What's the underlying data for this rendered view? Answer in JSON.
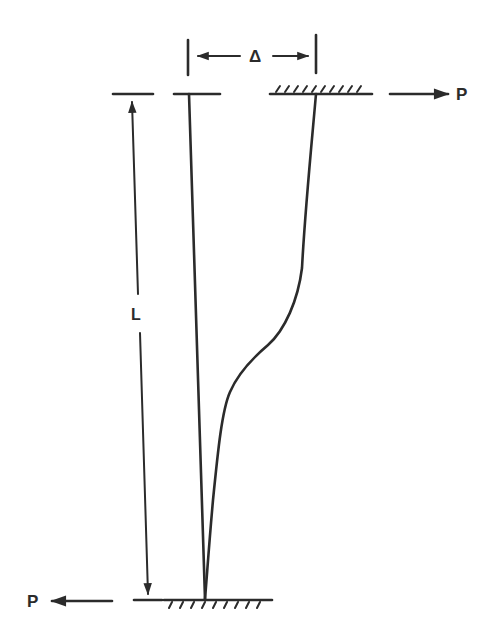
{
  "diagram": {
    "type": "column-sway-deflection",
    "labels": {
      "delta": "Δ",
      "length": "L",
      "load_top": "P",
      "load_bottom": "P"
    },
    "colors": {
      "ink": "#2b2b2b",
      "background": "#ffffff"
    },
    "elements": [
      "original undeflected column (straight line)",
      "deflected column shape (curve)",
      "fixed support at top (hatched, moving laterally)",
      "fixed support at base (hatched)",
      "dimension Δ (lateral displacement)",
      "dimension L (column length)",
      "load P at top pointing right",
      "load P at base pointing left"
    ]
  }
}
